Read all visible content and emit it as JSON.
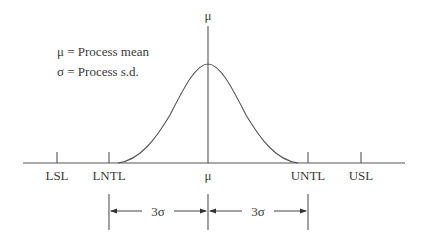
{
  "legend": {
    "mu_line": "μ = Process mean",
    "sigma_line": "σ = Process s.d."
  },
  "top_label": "μ",
  "axis": {
    "ticks": [
      {
        "id": "lsl",
        "label": "LSL",
        "x": 57
      },
      {
        "id": "lntl",
        "label": "LNTL",
        "x": 109
      },
      {
        "id": "mu",
        "label": "μ",
        "x": 208
      },
      {
        "id": "untl",
        "label": "UNTL",
        "x": 308
      },
      {
        "id": "usl",
        "label": "USL",
        "x": 361
      }
    ]
  },
  "spans": {
    "left": "3σ",
    "right": "3σ"
  },
  "colors": {
    "stroke": "#555555",
    "text": "#3a3a3a",
    "background": "#ffffff"
  }
}
